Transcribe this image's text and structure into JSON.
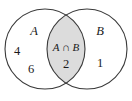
{
  "figure": {
    "type": "venn-diagram",
    "background_color": "#ffffff",
    "stroke_color": "#3a3a3a",
    "shading_color": "#dcdcdc",
    "text_color": "#1a1a1a"
  },
  "sets": {
    "left": {
      "label": "A",
      "elements": [
        "4",
        "6"
      ]
    },
    "right": {
      "label": "B",
      "elements": [
        "1"
      ]
    },
    "intersection": {
      "label": "A ∩ B",
      "elements": [
        "2"
      ],
      "shaded": true
    }
  }
}
